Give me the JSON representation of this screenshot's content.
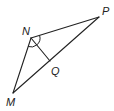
{
  "figure": {
    "type": "triangle-diagram",
    "stroke_color": "#222222",
    "background": "#ffffff",
    "vertices": {
      "N": {
        "label": "N",
        "x": 31,
        "y": 38,
        "label_x": 22,
        "label_y": 35
      },
      "P": {
        "label": "P",
        "x": 99,
        "y": 17,
        "label_x": 102,
        "label_y": 15
      },
      "M": {
        "label": "M",
        "x": 13,
        "y": 93,
        "label_x": 6,
        "label_y": 106
      },
      "Q": {
        "label": "Q",
        "x": 50,
        "y": 61,
        "label_x": 51,
        "label_y": 75
      }
    },
    "segments": [
      {
        "from": "N",
        "to": "P"
      },
      {
        "from": "P",
        "to": "M"
      },
      {
        "from": "M",
        "to": "N"
      },
      {
        "from": "N",
        "to": "Q"
      }
    ],
    "angle_marks": [
      {
        "vertex": "N",
        "between": [
          "M",
          "Q"
        ],
        "type": "arc"
      },
      {
        "vertex": "N",
        "between": [
          "Q",
          "P"
        ],
        "type": "arc"
      }
    ]
  }
}
